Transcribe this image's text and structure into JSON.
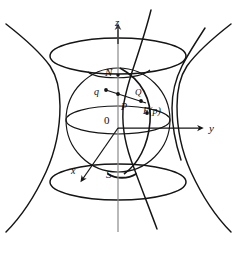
{
  "figure": {
    "stroke_color": "#151515",
    "axis_color": "#6e6e6e",
    "background_color": "#ffffff",
    "labels": {
      "z_axis": "z",
      "y_axis": "y",
      "x_axis": "x",
      "origin": "0",
      "north_pole": "N",
      "south_pole": "S",
      "point_q_lower": "q",
      "point_Q_upper": "Q",
      "point_P": "P",
      "point_Fp": "F(p)"
    },
    "elements": [
      {
        "name": "hyperboloid-left-branch",
        "kind": "curve"
      },
      {
        "name": "hyperboloid-right-branch",
        "kind": "curve"
      },
      {
        "name": "hyperboloid-inner-left-branch",
        "kind": "curve"
      },
      {
        "name": "hyperboloid-inner-right-branch",
        "kind": "curve"
      },
      {
        "name": "hyperboloid-top-ellipse",
        "kind": "ellipse"
      },
      {
        "name": "hyperboloid-bottom-ellipse",
        "kind": "ellipse"
      },
      {
        "name": "sphere-outline",
        "kind": "circle"
      },
      {
        "name": "sphere-equator",
        "kind": "ellipse"
      },
      {
        "name": "sphere-meridian-arc",
        "kind": "arc"
      },
      {
        "name": "z-axis",
        "kind": "axis"
      },
      {
        "name": "y-axis",
        "kind": "axis"
      },
      {
        "name": "x-axis",
        "kind": "axis"
      },
      {
        "name": "projection-ray",
        "kind": "segment"
      }
    ]
  }
}
